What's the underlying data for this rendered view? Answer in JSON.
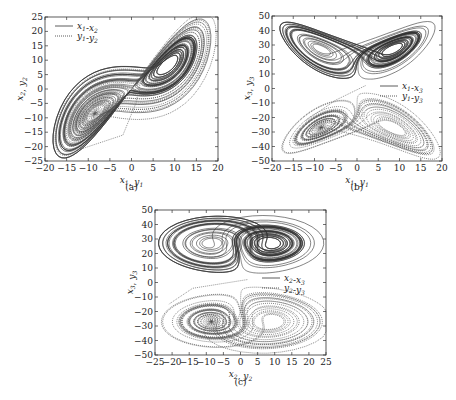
{
  "chart_data": [
    {
      "id": "a",
      "type": "line",
      "caption": "(a)",
      "xlabel": "x1, y1",
      "ylabel": "x2, y2",
      "xlim": [
        -20,
        20
      ],
      "ylim": [
        -25,
        25
      ],
      "xticks": [
        -20,
        -15,
        -10,
        -5,
        0,
        5,
        10,
        15,
        20
      ],
      "yticks": [
        -25,
        -20,
        -15,
        -10,
        -5,
        0,
        5,
        10,
        15,
        20,
        25
      ],
      "legend": {
        "position": "top-left",
        "entries": [
          {
            "label": "x1-x2",
            "style": "solid"
          },
          {
            "label": "y1-y2",
            "style": "dotted"
          }
        ]
      },
      "series": [
        {
          "name": "x1-x2",
          "style": "solid",
          "kind": "lorenz",
          "sx": 1,
          "sy": 1,
          "flipY": false,
          "offsetY": 0,
          "xdim": "x",
          "ydim": "y"
        },
        {
          "name": "y1-y2",
          "style": "dotted",
          "kind": "lorenz",
          "sx": 1,
          "sy": 1,
          "flipY": false,
          "offsetY": 0,
          "xdim": "x",
          "ydim": "y",
          "transient": [
            [
              2,
              2
            ],
            [
              1,
              -5
            ],
            [
              -2,
              -16
            ],
            [
              -12,
              -21
            ]
          ]
        }
      ]
    },
    {
      "id": "b",
      "type": "line",
      "caption": "(b)",
      "xlabel": "x1, y1",
      "ylabel": "x3, y3",
      "xlim": [
        -20,
        20
      ],
      "ylim": [
        -50,
        50
      ],
      "xticks": [
        -20,
        -15,
        -10,
        -5,
        0,
        5,
        10,
        15,
        20
      ],
      "yticks": [
        -50,
        -40,
        -30,
        -20,
        -10,
        0,
        10,
        20,
        30,
        40,
        50
      ],
      "legend": {
        "position": "center-right",
        "entries": [
          {
            "label": "x1-x3",
            "style": "solid"
          },
          {
            "label": "y1-y3",
            "style": "dotted"
          }
        ]
      },
      "series": [
        {
          "name": "x1-x3",
          "style": "solid",
          "kind": "lorenz",
          "xdim": "x",
          "ydim": "z",
          "flipY": false,
          "offsetY": 0
        },
        {
          "name": "y1-y3",
          "style": "dotted",
          "kind": "lorenz",
          "xdim": "x",
          "ydim": "z",
          "flipY": true,
          "offsetY": 0,
          "transient": [
            [
              2,
              2
            ],
            [
              -5,
              -8
            ],
            [
              -12,
              -22
            ]
          ]
        }
      ]
    },
    {
      "id": "c",
      "type": "line",
      "caption": "(c)",
      "xlabel": "x2, y2",
      "ylabel": "x3, y3",
      "xlim": [
        -25,
        25
      ],
      "ylim": [
        -50,
        50
      ],
      "xticks": [
        -25,
        -20,
        -15,
        -10,
        -5,
        0,
        5,
        10,
        15,
        20,
        25
      ],
      "yticks": [
        -50,
        -40,
        -30,
        -20,
        -10,
        0,
        10,
        20,
        30,
        40,
        50
      ],
      "legend": {
        "position": "center-right",
        "entries": [
          {
            "label": "x2-x3",
            "style": "solid"
          },
          {
            "label": "y2-y3",
            "style": "dotted"
          }
        ]
      },
      "series": [
        {
          "name": "x2-x3",
          "style": "solid",
          "kind": "lorenz",
          "xdim": "y",
          "ydim": "z",
          "flipY": false,
          "offsetY": 0
        },
        {
          "name": "y2-y3",
          "style": "dotted",
          "kind": "lorenz",
          "xdim": "y",
          "ydim": "z",
          "flipY": true,
          "offsetY": 0,
          "transient": [
            [
              2,
              2
            ],
            [
              -14,
              -4
            ],
            [
              -21,
              -15
            ]
          ]
        }
      ]
    }
  ]
}
